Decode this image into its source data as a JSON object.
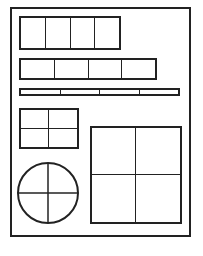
{
  "diagram": {
    "type": "layout-wireframe",
    "stroke_color": "#222222",
    "background_color": "#ffffff",
    "frame": {
      "x": 10,
      "y": 7,
      "w": 181,
      "h": 230
    },
    "row_1": {
      "x": 19,
      "y": 16,
      "w": 102,
      "h": 34,
      "cells": 4
    },
    "row_2": {
      "x": 19,
      "y": 58,
      "w": 138,
      "h": 22,
      "cells": 4
    },
    "row_3": {
      "x": 19,
      "y": 88,
      "w": 161,
      "h": 8,
      "cells": 4
    },
    "small_grid": {
      "x": 19,
      "y": 108,
      "w": 60,
      "h": 41,
      "rows": 2,
      "cols": 2
    },
    "circle": {
      "cx": 48,
      "cy": 193,
      "r": 30,
      "divided": "quadrants"
    },
    "large_grid": {
      "x": 90,
      "y": 126,
      "w": 92,
      "h": 98,
      "rows": 2,
      "cols": 2
    }
  }
}
